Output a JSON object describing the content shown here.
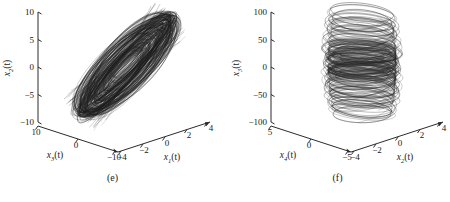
{
  "figure": {
    "background": "#ffffff",
    "line_color": "#000000",
    "axis_color": "#2b2b2b"
  },
  "panels": [
    {
      "caption": "(e)",
      "vertical_axis": {
        "label_base": "x",
        "label_sub": "2",
        "label_suffix": "(t)"
      },
      "left_axis": {
        "label_base": "x",
        "label_sub": "3",
        "label_suffix": "(t)"
      },
      "right_axis": {
        "label_base": "x",
        "label_sub": "1",
        "label_suffix": "(t)"
      },
      "vertical_ticks": [
        "10",
        "5",
        "0",
        "-5",
        "-10"
      ],
      "left_ticks": [
        "10",
        "0",
        "-10"
      ],
      "right_ticks": [
        "-4",
        "-2",
        "0",
        "2",
        "4"
      ]
    },
    {
      "caption": "(f)",
      "vertical_axis": {
        "label_base": "x",
        "label_sub": "3",
        "label_suffix": "(t)"
      },
      "left_axis": {
        "label_base": "x",
        "label_sub": "4",
        "label_suffix": "(t)"
      },
      "right_axis": {
        "label_base": "x",
        "label_sub": "2",
        "label_suffix": "(t)"
      },
      "vertical_ticks": [
        "100",
        "50",
        "0",
        "-50",
        "-100"
      ],
      "left_ticks": [
        "5",
        "0",
        "-5"
      ],
      "right_ticks": [
        "-4",
        "-2",
        "0",
        "2",
        "4"
      ]
    }
  ],
  "chart_data": [
    {
      "type": "line",
      "subplot": "(e)",
      "projection": "3d",
      "title": "",
      "xlabel": "x1(t)",
      "ylabel": "x3(t)",
      "zlabel": "x2(t)",
      "xlim": [
        -4,
        4
      ],
      "ylim": [
        -10,
        10
      ],
      "zlim": [
        -10,
        10
      ],
      "xticks": [
        -4,
        -2,
        0,
        2,
        4
      ],
      "yticks": [
        10,
        0,
        -10
      ],
      "zticks": [
        -10,
        -5,
        0,
        5,
        10
      ],
      "grid": false,
      "legend": null,
      "description": "Dense chaotic attractor forming an elongated tilted ellipsoidal band of trajectories spanning the full x2 range from -10 to 10, narrow in cross-section, oriented diagonally from upper-left to lower-right.",
      "series": [
        {
          "name": "trajectory",
          "color": "#000000",
          "note": "single continuous chaotic orbit, many thousands of samples, drawn as thin black lines"
        }
      ]
    },
    {
      "type": "line",
      "subplot": "(f)",
      "projection": "3d",
      "title": "",
      "xlabel": "x2(t)",
      "ylabel": "x4(t)",
      "zlabel": "x3(t)",
      "xlim": [
        -4,
        4
      ],
      "ylim": [
        -5,
        5
      ],
      "zlim": [
        -100,
        100
      ],
      "xticks": [
        -4,
        -2,
        0,
        2,
        4
      ],
      "yticks": [
        5,
        0,
        -5
      ],
      "zticks": [
        -100,
        -50,
        0,
        50,
        100
      ],
      "grid": false,
      "legend": null,
      "description": "Barrel or torus shaped chaotic attractor composed of stacked near-circular loops spanning x3 from about -100 to 100, with visible helical banding and a denser tangled core near x3 = 0.",
      "series": [
        {
          "name": "trajectory",
          "color": "#000000",
          "note": "single continuous chaotic orbit winding in stacked loops"
        }
      ]
    }
  ]
}
